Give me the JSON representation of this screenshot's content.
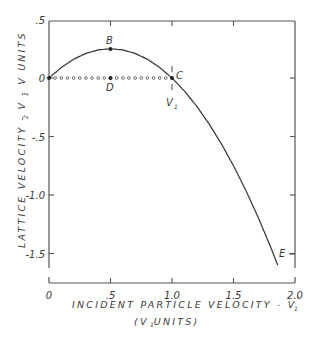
{
  "chart_data": {
    "type": "line",
    "title": "",
    "xlabel": "INCIDENT PARTICLE VELOCITY - V1'",
    "xlabel_sub": "(V1 UNITS)",
    "ylabel": "LATTICE VELOCITY - V2 - V1 UNITS",
    "xlim": [
      0,
      2.0
    ],
    "ylim": [
      -1.6,
      0.5
    ],
    "x_ticks": [
      0,
      0.5,
      1.0,
      1.5,
      2.0
    ],
    "x_tick_labels": [
      "0",
      ".5",
      "1.0",
      "1.5",
      "2.0"
    ],
    "y_ticks": [
      0.5,
      0,
      -0.5,
      -1.0,
      -1.5
    ],
    "y_tick_labels": [
      ".5",
      "0",
      "-.5",
      "-1.0",
      "-1.5"
    ],
    "grid": false,
    "legend": null,
    "series": [
      {
        "name": "lattice velocity curve",
        "style": "solid",
        "x": [
          0,
          0.1,
          0.2,
          0.3,
          0.4,
          0.5,
          0.6,
          0.7,
          0.8,
          0.9,
          1.0,
          1.1,
          1.2,
          1.3,
          1.4,
          1.5,
          1.6,
          1.7,
          1.8,
          1.86
        ],
        "y": [
          0,
          0.09,
          0.16,
          0.21,
          0.24,
          0.25,
          0.24,
          0.21,
          0.16,
          0.09,
          0,
          -0.11,
          -0.24,
          -0.39,
          -0.56,
          -0.75,
          -0.96,
          -1.19,
          -1.44,
          -1.6
        ]
      },
      {
        "name": "reference line",
        "style": "dotted-circles",
        "x": [
          0,
          1.0
        ],
        "y": [
          0,
          0
        ]
      }
    ],
    "annotations": [
      {
        "label": "B",
        "x": 0.5,
        "y": 0.25
      },
      {
        "label": "C",
        "x": 1.0,
        "y": 0
      },
      {
        "label": "D",
        "x": 0.5,
        "y": 0
      },
      {
        "label": "V1",
        "x": 1.0,
        "y": -0.12
      },
      {
        "label": "E",
        "x": 1.9,
        "y": -1.5
      }
    ]
  },
  "labels": {
    "x_title": "INCIDENT PARTICLE VELOCITY - V",
    "x_title_sub": "(V  UNITS)",
    "y_title": "LATTICE VELOCITY - V  - V  UNITS",
    "point_b": "B",
    "point_c": "C",
    "point_d": "D",
    "point_e": "E",
    "v1_marker": "V"
  }
}
